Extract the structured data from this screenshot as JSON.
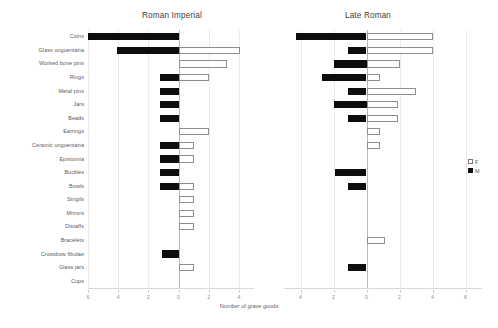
{
  "figure": {
    "x_axis_title": "Number of grave goods",
    "legend": [
      {
        "key": "F",
        "label": "F",
        "color": "#ffffff",
        "style": "open"
      },
      {
        "key": "M",
        "label": "M",
        "color": "#0d0d0d",
        "style": "filled"
      }
    ]
  },
  "categories": [
    "Coins",
    "Glass unguentaria",
    "Worked bone pins",
    "Rings",
    "Metal pins",
    "Jars",
    "Beads",
    "Earrings",
    "Ceramic unguentaria",
    "Epistomia",
    "Buckles",
    "Bowls",
    "Strigils",
    "Mirrors",
    "Distaffs",
    "Bracelets",
    "Crossbow fibulae",
    "Glass jars",
    "Cups"
  ],
  "chart_data": [
    {
      "type": "bar",
      "title": "Roman Imperial",
      "orientation": "horizontal-diverging",
      "xlabel": "Number of grave goods",
      "ylabel": "",
      "xlim": [
        -6,
        5
      ],
      "xticks": [
        -6,
        -4,
        -2,
        0,
        2,
        4
      ],
      "xticklabels": [
        "6",
        "4",
        "2",
        "0",
        "2",
        "4"
      ],
      "grid": true,
      "legend_position": "outside-right",
      "categories": [
        "Coins",
        "Glass unguentaria",
        "Worked bone pins",
        "Rings",
        "Metal pins",
        "Jars",
        "Beads",
        "Earrings",
        "Ceramic unguentaria",
        "Epistomia",
        "Buckles",
        "Bowls",
        "Strigils",
        "Mirrors",
        "Distaffs",
        "Bracelets",
        "Crossbow fibulae",
        "Glass jars",
        "Cups"
      ],
      "series": [
        {
          "name": "M",
          "side": "left",
          "values": [
            6.0,
            4.1,
            0.0,
            1.2,
            1.2,
            1.2,
            1.2,
            0.0,
            1.2,
            1.2,
            1.2,
            1.2,
            0.0,
            0.0,
            0.0,
            0.0,
            1.1,
            0.0,
            0.0
          ]
        },
        {
          "name": "F",
          "side": "right",
          "values": [
            0.0,
            4.1,
            3.2,
            2.0,
            0.0,
            0.0,
            0.0,
            2.0,
            1.0,
            1.0,
            0.0,
            1.0,
            1.0,
            1.0,
            1.0,
            0.0,
            0.0,
            1.0,
            0.0
          ]
        }
      ]
    },
    {
      "type": "bar",
      "title": "Late Roman",
      "orientation": "horizontal-diverging",
      "xlabel": "Number of grave goods",
      "ylabel": "",
      "xlim": [
        -5,
        7
      ],
      "xticks": [
        -4,
        -2,
        0,
        2,
        4,
        6
      ],
      "xticklabels": [
        "4",
        "2",
        "0",
        "2",
        "4",
        "6"
      ],
      "grid": true,
      "legend_position": "outside-right",
      "categories": [
        "Coins",
        "Glass unguentaria",
        "Worked bone pins",
        "Rings",
        "Metal pins",
        "Jars",
        "Beads",
        "Earrings",
        "Ceramic unguentaria",
        "Epistomia",
        "Buckles",
        "Bowls",
        "Strigils",
        "Mirrors",
        "Distaffs",
        "Bracelets",
        "Crossbow fibulae",
        "Glass jars",
        "Cups"
      ],
      "series": [
        {
          "name": "M",
          "side": "left",
          "values": [
            4.3,
            1.1,
            2.0,
            2.7,
            1.1,
            2.0,
            1.1,
            0.0,
            0.0,
            0.0,
            1.9,
            1.1,
            0.0,
            0.0,
            0.0,
            0.0,
            0.0,
            1.1,
            0.0
          ]
        },
        {
          "name": "F",
          "side": "right",
          "values": [
            4.0,
            4.0,
            2.0,
            0.8,
            3.0,
            1.9,
            1.9,
            0.8,
            0.8,
            0.0,
            0.0,
            0.0,
            0.0,
            0.0,
            0.0,
            1.1,
            0.0,
            0.0,
            0.0
          ]
        }
      ]
    }
  ]
}
